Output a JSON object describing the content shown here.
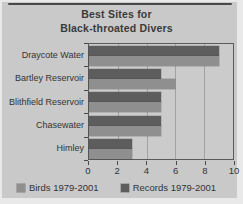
{
  "title": {
    "line1": "Best Sites for",
    "line2": "Black-throated Divers"
  },
  "chart_data": {
    "type": "bar",
    "orientation": "horizontal",
    "title": "Best Sites for Black-throated Divers",
    "categories": [
      "Draycote Water",
      "Bartley Reservoir",
      "Blithfield Reservoir",
      "Chasewater",
      "Himley"
    ],
    "series": [
      {
        "name": "Birds 1979-2001",
        "color": "#8f8f8f",
        "values": [
          9,
          6,
          5,
          5,
          3
        ]
      },
      {
        "name": "Records 1979-2001",
        "color": "#5d5d5d",
        "values": [
          9,
          5,
          5,
          5,
          3
        ]
      }
    ],
    "xlim": [
      0,
      10
    ],
    "x_ticks": [
      0,
      2,
      4,
      6,
      8,
      10
    ],
    "gridlines_at": [
      2,
      4,
      6,
      8
    ],
    "grid": true,
    "legend_position": "bottom",
    "note": "within each category group the Records bar is drawn on top and the Birds bar below"
  },
  "colors": {
    "page_background": "#e9e9e9",
    "chart_background": "#c9c9c9",
    "plot_background": "#cbcbcb",
    "plot_border": "#5a5a5a",
    "gridline": "#a2a2a2",
    "text": "#333333",
    "birds_bar": "#8f8f8f",
    "records_bar": "#5d5d5d"
  }
}
